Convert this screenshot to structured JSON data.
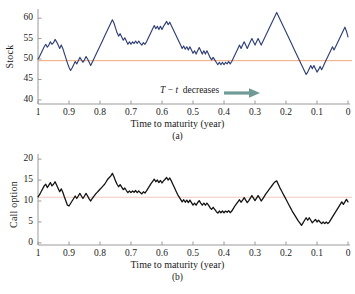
{
  "figure": {
    "background": "#ffffff",
    "caption_a": "(a)",
    "caption_b": "(b)",
    "footer_fragment": " "
  },
  "colors": {
    "stock_line": "#2f3f77",
    "option_line": "#141414",
    "reference_line_a": "#f0a878",
    "reference_line_b": "#f0c8c0",
    "axis": "#9a9a9a",
    "text": "#1a1a1a",
    "arrow": "#6f9a95"
  },
  "annotation": {
    "symbol_T": "T",
    "minus": " − ",
    "symbol_t": "t",
    "text": "decreases",
    "arrow_icon": "right-arrow-icon"
  },
  "chart_data": [
    {
      "id": "panel-a",
      "type": "line",
      "title": "",
      "xlabel": "Time to maturity (year)",
      "ylabel": "Stock",
      "xlim": [
        1.0,
        0.0
      ],
      "ylim": [
        39.0,
        61.5
      ],
      "xticks": [
        "1",
        "0.9",
        "0.8",
        "0.7",
        "0.6",
        "0.5",
        "0.4",
        "0.3",
        "0.2",
        "0.1",
        "0"
      ],
      "xtick_values": [
        1.0,
        0.9,
        0.8,
        0.7,
        0.6,
        0.5,
        0.4,
        0.3,
        0.2,
        0.1,
        0.0
      ],
      "yticks": [
        "40",
        "45",
        "50",
        "55",
        "60"
      ],
      "ytick_values": [
        40,
        45,
        50,
        55,
        60
      ],
      "grid": false,
      "legend": null,
      "reference_line": {
        "label": "strike",
        "value": 49.6,
        "color": "#f0a878"
      },
      "series": [
        {
          "name": "Stock",
          "color": "#2f3f77",
          "x": [
            1.0,
            0.995,
            0.99,
            0.985,
            0.98,
            0.975,
            0.97,
            0.965,
            0.96,
            0.955,
            0.95,
            0.945,
            0.94,
            0.935,
            0.93,
            0.925,
            0.92,
            0.915,
            0.91,
            0.905,
            0.9,
            0.895,
            0.89,
            0.885,
            0.88,
            0.875,
            0.87,
            0.865,
            0.86,
            0.855,
            0.85,
            0.845,
            0.84,
            0.835,
            0.83,
            0.825,
            0.82,
            0.815,
            0.81,
            0.805,
            0.8,
            0.795,
            0.79,
            0.785,
            0.78,
            0.775,
            0.77,
            0.765,
            0.76,
            0.755,
            0.75,
            0.745,
            0.74,
            0.735,
            0.73,
            0.725,
            0.72,
            0.715,
            0.71,
            0.705,
            0.7,
            0.695,
            0.69,
            0.685,
            0.68,
            0.675,
            0.67,
            0.665,
            0.66,
            0.655,
            0.65,
            0.645,
            0.64,
            0.635,
            0.63,
            0.625,
            0.62,
            0.615,
            0.61,
            0.605,
            0.6,
            0.595,
            0.59,
            0.585,
            0.58,
            0.575,
            0.57,
            0.565,
            0.56,
            0.555,
            0.55,
            0.545,
            0.54,
            0.535,
            0.53,
            0.525,
            0.52,
            0.515,
            0.51,
            0.505,
            0.5,
            0.495,
            0.49,
            0.485,
            0.48,
            0.475,
            0.47,
            0.465,
            0.46,
            0.455,
            0.45,
            0.445,
            0.44,
            0.435,
            0.43,
            0.425,
            0.42,
            0.415,
            0.41,
            0.405,
            0.4,
            0.395,
            0.39,
            0.385,
            0.38,
            0.375,
            0.37,
            0.365,
            0.36,
            0.355,
            0.35,
            0.345,
            0.34,
            0.335,
            0.33,
            0.325,
            0.32,
            0.315,
            0.31,
            0.305,
            0.3,
            0.295,
            0.29,
            0.285,
            0.28,
            0.275,
            0.27,
            0.265,
            0.26,
            0.255,
            0.25,
            0.245,
            0.24,
            0.235,
            0.23,
            0.225,
            0.22,
            0.215,
            0.21,
            0.205,
            0.2,
            0.195,
            0.19,
            0.185,
            0.18,
            0.175,
            0.17,
            0.165,
            0.16,
            0.155,
            0.15,
            0.145,
            0.14,
            0.135,
            0.13,
            0.125,
            0.12,
            0.115,
            0.11,
            0.105,
            0.1,
            0.095,
            0.09,
            0.085,
            0.08,
            0.075,
            0.07,
            0.065,
            0.06,
            0.055,
            0.05,
            0.045,
            0.04,
            0.035,
            0.03,
            0.025,
            0.02,
            0.015,
            0.01,
            0.005,
            0.0
          ],
          "y": [
            50.0,
            50.6,
            51.4,
            52.2,
            53.0,
            53.6,
            52.9,
            53.4,
            54.2,
            53.6,
            54.0,
            54.8,
            54.2,
            53.4,
            52.6,
            53.4,
            52.6,
            51.4,
            50.2,
            49.0,
            48.0,
            47.2,
            47.8,
            48.6,
            49.4,
            48.8,
            49.6,
            50.4,
            49.8,
            49.2,
            49.8,
            50.6,
            50.0,
            49.2,
            48.4,
            49.2,
            50.0,
            50.8,
            51.6,
            52.4,
            53.2,
            54.0,
            54.8,
            55.6,
            56.4,
            57.2,
            58.0,
            58.8,
            59.6,
            58.8,
            57.6,
            56.4,
            55.6,
            56.2,
            55.4,
            54.6,
            55.2,
            54.4,
            53.6,
            54.2,
            53.6,
            54.2,
            53.8,
            54.4,
            53.8,
            54.4,
            53.8,
            53.4,
            54.0,
            53.6,
            54.2,
            55.0,
            55.8,
            56.6,
            57.4,
            58.2,
            57.4,
            58.0,
            57.2,
            58.0,
            57.2,
            58.0,
            58.6,
            59.2,
            58.4,
            59.0,
            58.2,
            57.4,
            56.6,
            55.8,
            55.0,
            54.2,
            53.4,
            52.6,
            53.2,
            52.4,
            53.0,
            52.2,
            53.0,
            52.2,
            51.4,
            52.0,
            51.2,
            52.0,
            52.8,
            52.0,
            51.2,
            52.0,
            51.2,
            52.0,
            51.2,
            50.4,
            49.8,
            50.4,
            49.8,
            49.2,
            48.6,
            49.2,
            48.6,
            49.2,
            48.6,
            49.2,
            48.8,
            49.4,
            48.8,
            49.4,
            50.2,
            51.0,
            51.8,
            52.6,
            53.4,
            52.6,
            53.4,
            54.2,
            53.4,
            52.6,
            53.4,
            54.2,
            55.0,
            54.2,
            53.4,
            54.2,
            55.0,
            54.2,
            53.4,
            54.2,
            55.0,
            55.8,
            56.6,
            57.4,
            58.2,
            59.0,
            59.8,
            60.6,
            61.4,
            60.6,
            59.8,
            59.0,
            58.2,
            57.4,
            56.6,
            55.8,
            55.0,
            54.2,
            53.4,
            52.6,
            51.8,
            51.0,
            50.2,
            49.4,
            48.6,
            47.8,
            47.0,
            46.2,
            46.8,
            47.6,
            48.4,
            47.6,
            48.4,
            47.6,
            46.8,
            47.4,
            48.2,
            47.4,
            48.2,
            49.0,
            49.8,
            50.6,
            51.4,
            52.2,
            53.0,
            52.2,
            53.0,
            53.8,
            54.6,
            55.4,
            56.2,
            57.0,
            57.8,
            56.8,
            55.4,
            54.0,
            52.8,
            53.6,
            54.4,
            55.2,
            56.0,
            56.8,
            57.6,
            58.4,
            57.6,
            58.4,
            59.2,
            58.4,
            57.6,
            58.4,
            59.2,
            58.4,
            57.6,
            58.4,
            59.2,
            60.0,
            59.2,
            58.4,
            59.2,
            60.0,
            59.2,
            58.4,
            57.6,
            56.8,
            56.0,
            55.2,
            54.4,
            53.6,
            52.8,
            52.0,
            51.0,
            50.0,
            49.0,
            48.0,
            47.0,
            46.0,
            45.4,
            44.8,
            45.4,
            44.8,
            44.4,
            45.0,
            44.6,
            45.2,
            44.8,
            44.4,
            44.0,
            43.4,
            42.8,
            43.4,
            42.8,
            43.4,
            42.8,
            42.2,
            41.6,
            41.0,
            40.4,
            39.8,
            40.6,
            41.4,
            42.2,
            43.0,
            43.8,
            44.6,
            45.4,
            46.2,
            45.4,
            44.6,
            43.8,
            43.0,
            42.2,
            41.4,
            40.6,
            39.8,
            40.2,
            39.9
          ]
        }
      ]
    },
    {
      "id": "panel-b",
      "type": "line",
      "title": "",
      "xlabel": "Time to maturity (year)",
      "ylabel": "Call option",
      "xlim": [
        1.0,
        0.0
      ],
      "ylim": [
        -0.5,
        20.5
      ],
      "xticks": [
        "1",
        "0.9",
        "0.8",
        "0.7",
        "0.6",
        "0.5",
        "0.4",
        "0.3",
        "0.2",
        "0.1",
        "0"
      ],
      "xtick_values": [
        1.0,
        0.9,
        0.8,
        0.7,
        0.6,
        0.5,
        0.4,
        0.3,
        0.2,
        0.1,
        0.0
      ],
      "yticks": [
        "0",
        "5",
        "10",
        "15",
        "20"
      ],
      "ytick_values": [
        0,
        5,
        10,
        15,
        20
      ],
      "grid": false,
      "legend": null,
      "reference_line": {
        "label": "strike-value",
        "value": 10.9,
        "color": "#f0c8c0"
      },
      "series": [
        {
          "name": "Call option",
          "color": "#141414",
          "x": [
            1.0,
            0.995,
            0.99,
            0.985,
            0.98,
            0.975,
            0.97,
            0.965,
            0.96,
            0.955,
            0.95,
            0.945,
            0.94,
            0.935,
            0.93,
            0.925,
            0.92,
            0.915,
            0.91,
            0.905,
            0.9,
            0.895,
            0.89,
            0.885,
            0.88,
            0.875,
            0.87,
            0.865,
            0.86,
            0.855,
            0.85,
            0.845,
            0.84,
            0.835,
            0.83,
            0.825,
            0.82,
            0.815,
            0.81,
            0.805,
            0.8,
            0.795,
            0.79,
            0.785,
            0.78,
            0.775,
            0.77,
            0.765,
            0.76,
            0.755,
            0.75,
            0.745,
            0.74,
            0.735,
            0.73,
            0.725,
            0.72,
            0.715,
            0.71,
            0.705,
            0.7,
            0.695,
            0.69,
            0.685,
            0.68,
            0.675,
            0.67,
            0.665,
            0.66,
            0.655,
            0.65,
            0.645,
            0.64,
            0.635,
            0.63,
            0.625,
            0.62,
            0.615,
            0.61,
            0.605,
            0.6,
            0.595,
            0.59,
            0.585,
            0.58,
            0.575,
            0.57,
            0.565,
            0.56,
            0.555,
            0.55,
            0.545,
            0.54,
            0.535,
            0.53,
            0.525,
            0.52,
            0.515,
            0.51,
            0.505,
            0.5,
            0.495,
            0.49,
            0.485,
            0.48,
            0.475,
            0.47,
            0.465,
            0.46,
            0.455,
            0.45,
            0.445,
            0.44,
            0.435,
            0.43,
            0.425,
            0.42,
            0.415,
            0.41,
            0.405,
            0.4,
            0.395,
            0.39,
            0.385,
            0.38,
            0.375,
            0.37,
            0.365,
            0.36,
            0.355,
            0.35,
            0.345,
            0.34,
            0.335,
            0.33,
            0.325,
            0.32,
            0.315,
            0.31,
            0.305,
            0.3,
            0.295,
            0.29,
            0.285,
            0.28,
            0.275,
            0.27,
            0.265,
            0.26,
            0.255,
            0.25,
            0.245,
            0.24,
            0.235,
            0.23,
            0.225,
            0.22,
            0.215,
            0.21,
            0.205,
            0.2,
            0.195,
            0.19,
            0.185,
            0.18,
            0.175,
            0.17,
            0.165,
            0.16,
            0.155,
            0.15,
            0.145,
            0.14,
            0.135,
            0.13,
            0.125,
            0.12,
            0.115,
            0.11,
            0.105,
            0.1,
            0.095,
            0.09,
            0.085,
            0.08,
            0.075,
            0.07,
            0.065,
            0.06,
            0.055,
            0.05,
            0.045,
            0.04,
            0.035,
            0.03,
            0.025,
            0.02,
            0.015,
            0.01,
            0.005,
            0.0
          ],
          "y": [
            11.0,
            11.5,
            12.2,
            12.9,
            13.6,
            14.0,
            13.2,
            13.8,
            14.4,
            13.6,
            14.0,
            14.6,
            13.8,
            13.0,
            12.2,
            12.9,
            12.1,
            11.0,
            10.0,
            9.0,
            8.8,
            9.4,
            10.0,
            10.6,
            11.2,
            10.6,
            11.2,
            11.8,
            11.2,
            10.6,
            11.2,
            11.8,
            11.2,
            10.5,
            10.0,
            10.6,
            11.1,
            11.6,
            12.0,
            12.4,
            12.8,
            13.2,
            13.6,
            14.0,
            14.6,
            15.2,
            15.6,
            16.0,
            16.6,
            15.8,
            14.8,
            14.0,
            13.4,
            13.9,
            13.3,
            12.7,
            13.1,
            12.5,
            12.0,
            12.4,
            12.0,
            12.4,
            12.1,
            12.5,
            12.0,
            12.4,
            12.0,
            11.7,
            12.2,
            11.9,
            12.4,
            13.0,
            13.6,
            14.2,
            14.7,
            15.2,
            14.6,
            15.0,
            14.4,
            14.9,
            14.3,
            14.8,
            15.2,
            15.6,
            15.0,
            15.5,
            14.8,
            14.0,
            13.2,
            12.4,
            11.6,
            11.0,
            10.4,
            9.8,
            10.3,
            9.7,
            10.2,
            9.6,
            10.2,
            9.6,
            9.0,
            9.5,
            9.0,
            9.6,
            10.1,
            9.5,
            9.0,
            9.5,
            9.0,
            9.5,
            9.0,
            8.4,
            8.0,
            8.5,
            8.0,
            7.5,
            7.1,
            7.6,
            7.2,
            7.6,
            7.2,
            7.6,
            7.3,
            7.7,
            7.2,
            7.6,
            8.2,
            8.8,
            9.3,
            9.8,
            10.3,
            9.7,
            10.2,
            10.8,
            10.2,
            9.6,
            10.1,
            10.7,
            11.3,
            10.7,
            10.1,
            10.7,
            11.3,
            10.7,
            10.0,
            10.5,
            11.1,
            11.7,
            12.2,
            12.7,
            13.2,
            13.7,
            14.2,
            14.6,
            14.8,
            14.0,
            13.2,
            12.5,
            11.8,
            11.1,
            10.4,
            9.7,
            9.0,
            8.3,
            7.6,
            7.0,
            6.4,
            5.8,
            5.2,
            4.7,
            4.2,
            4.8,
            5.4,
            6.0,
            5.4,
            6.0,
            5.4,
            4.8,
            5.2,
            5.6,
            5.0,
            5.4,
            5.0,
            4.6,
            5.0,
            4.6,
            5.0,
            4.6,
            5.0,
            5.6,
            6.2,
            6.8,
            7.4,
            8.0,
            8.6,
            9.2,
            9.8,
            9.2,
            9.8,
            10.4,
            9.8,
            9.2,
            9.8,
            10.4,
            9.8,
            9.2,
            9.8,
            10.4,
            11.0,
            10.4,
            9.8,
            10.4,
            11.0,
            11.6,
            11.0,
            10.4,
            9.0,
            7.6,
            6.4,
            5.2,
            4.2,
            3.4,
            3.0,
            3.4,
            3.0,
            2.6,
            2.2,
            1.8,
            1.5,
            1.2,
            1.3,
            1.1,
            1.0,
            0.9,
            0.8,
            0.7,
            0.6,
            0.5,
            0.4,
            0.4,
            0.3,
            0.3,
            0.4,
            0.5,
            0.4,
            0.3,
            0.25,
            0.2,
            0.2,
            0.15,
            0.15,
            0.1,
            0.1,
            0.1
          ]
        }
      ]
    }
  ]
}
